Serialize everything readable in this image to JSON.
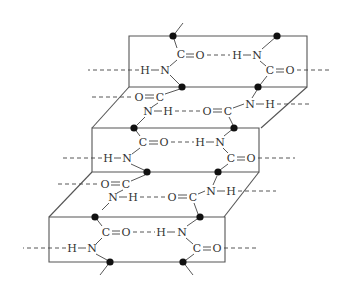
{
  "figure": {
    "type": "beta-sheet hydrogen bonding diagram",
    "atoms": {
      "carbon": "C",
      "oxygen": "O",
      "nitrogen": "N",
      "hydrogen": "H"
    },
    "groups": {
      "carbonyl": "C=O",
      "amide": "N-H"
    },
    "colors": {
      "line": "#555555",
      "text": "#333333",
      "alpha_carbon": "#111111",
      "background": "#ffffff"
    },
    "planes": 3,
    "alpha_carbon_marker": "filled-circle"
  }
}
